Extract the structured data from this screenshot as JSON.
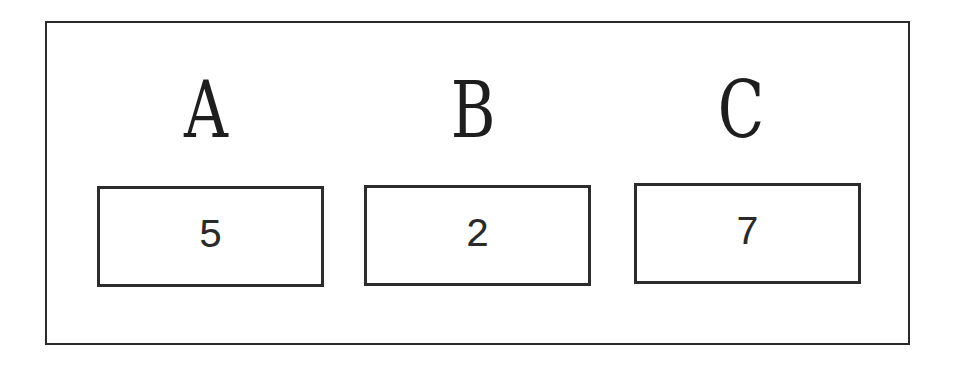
{
  "variables": [
    {
      "name": "A",
      "value": "5"
    },
    {
      "name": "B",
      "value": "2"
    },
    {
      "name": "C",
      "value": "7"
    }
  ]
}
